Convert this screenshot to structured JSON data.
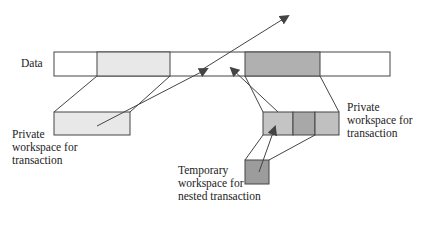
{
  "diagram": {
    "data_label": "Data",
    "left_workspace_label": "Private\nworkspace for\ntransaction",
    "right_workspace_label": "Private\nworkspace for\ntransaction",
    "temp_workspace_label": "Temporary\nworkspace for\nnested transaction",
    "colors": {
      "line": "#444444",
      "light_fill": "#e8e8e8",
      "medium_fill": "#c4c4c4",
      "dark_fill": "#a8a8a8",
      "darker_fill": "#9c9c9c",
      "white": "#ffffff"
    }
  }
}
